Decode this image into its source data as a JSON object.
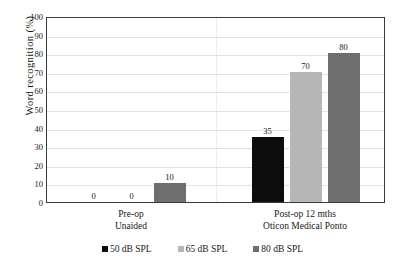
{
  "chart_data": {
    "type": "bar",
    "title": "",
    "xlabel": "",
    "ylabel": "Word  recognition  (%)",
    "ylim": [
      0,
      100
    ],
    "ytick_step": 10,
    "yticks": [
      100,
      90,
      80,
      70,
      60,
      50,
      40,
      30,
      20,
      10,
      0
    ],
    "grid": true,
    "legend_position": "bottom",
    "categories": [
      "Pre-op\nUnaided",
      "Post-op 12 mths\nOticon Medical Ponto"
    ],
    "category_lines": [
      [
        "Pre-op",
        "Unaided"
      ],
      [
        "Post-op 12 mths",
        "Oticon Medical Ponto"
      ]
    ],
    "series": [
      {
        "name": "50 dB SPL",
        "color": "#0d0d0d",
        "values": [
          0,
          35
        ]
      },
      {
        "name": "65 dB SPL",
        "color": "#b6b6b6",
        "values": [
          0,
          70
        ]
      },
      {
        "name": "80 dB SPL",
        "color": "#6e6e6e",
        "values": [
          10,
          80
        ]
      }
    ],
    "data_labels": [
      {
        "text": "0",
        "series": "50 dB SPL",
        "category": "Pre-op Unaided"
      },
      {
        "text": "0",
        "series": "65 dB SPL",
        "category": "Pre-op Unaided"
      },
      {
        "text": "10",
        "series": "80 dB SPL",
        "category": "Pre-op Unaided"
      },
      {
        "text": "35",
        "series": "50 dB SPL",
        "category": "Post-op 12 mths Oticon Medical Ponto"
      },
      {
        "text": "70",
        "series": "65 dB SPL",
        "category": "Post-op 12 mths Oticon Medical Ponto"
      },
      {
        "text": "80",
        "series": "80 dB SPL",
        "category": "Post-op 12 mths Oticon Medical Ponto"
      }
    ]
  },
  "axis": {
    "y_title": "Word  recognition  (%)",
    "tick_labels": [
      "100",
      "90",
      "80",
      "70",
      "60",
      "50",
      "40",
      "30",
      "20",
      "10",
      "0"
    ]
  },
  "categories": [
    {
      "line1": "Pre-op",
      "line2": "Unaided"
    },
    {
      "line1": "Post-op 12 mths",
      "line2": "Oticon Medical Ponto"
    }
  ],
  "bars": [
    {
      "label": "0",
      "value": 0,
      "series": "50 dB SPL",
      "group": 0
    },
    {
      "label": "0",
      "value": 0,
      "series": "65 dB SPL",
      "group": 0
    },
    {
      "label": "10",
      "value": 10,
      "series": "80 dB SPL",
      "group": 0
    },
    {
      "label": "35",
      "value": 35,
      "series": "50 dB SPL",
      "group": 1
    },
    {
      "label": "70",
      "value": 70,
      "series": "65 dB SPL",
      "group": 1
    },
    {
      "label": "80",
      "value": 80,
      "series": "80 dB SPL",
      "group": 1
    }
  ],
  "legend": {
    "items": [
      {
        "label": "50 dB SPL",
        "color": "#0d0d0d"
      },
      {
        "label": "65 dB SPL",
        "color": "#b6b6b6"
      },
      {
        "label": "80 dB SPL",
        "color": "#6e6e6e"
      }
    ]
  },
  "colors": {
    "series_50db": "#0d0d0d",
    "series_65db": "#b6b6b6",
    "series_80db": "#6e6e6e",
    "gridline": "#e2e2e2",
    "frame": "#3a3a3a",
    "text": "#171717",
    "background": "#ffffff"
  }
}
